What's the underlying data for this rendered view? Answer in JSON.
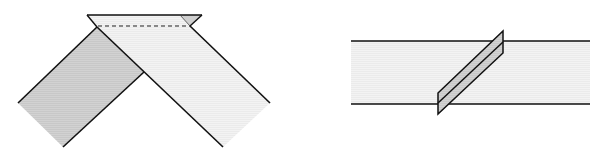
{
  "diagram": {
    "colors": {
      "background": "#ffffff",
      "stroke": "#111111",
      "light_fill": "#f0f0f0",
      "dark_fill": "#cfcfcf",
      "fold_fill": "#c8c8c8"
    },
    "left_figure": {
      "name": "strip-folded-at-angle",
      "top_edge": [
        [
          87,
          15
        ],
        [
          202,
          15
        ]
      ],
      "dashed_fold_line": [
        [
          98,
          26
        ],
        [
          190,
          26
        ]
      ],
      "dark_band": [
        [
          97,
          27
        ],
        [
          144,
          72
        ],
        [
          63,
          147
        ],
        [
          18,
          103
        ]
      ],
      "light_band": [
        [
          87,
          15
        ],
        [
          202,
          15
        ],
        [
          190,
          26
        ],
        [
          270,
          103
        ],
        [
          223,
          147
        ],
        [
          97,
          27
        ]
      ],
      "small_triangle": [
        [
          180,
          15
        ],
        [
          202,
          15
        ],
        [
          190,
          26
        ]
      ]
    },
    "right_figure": {
      "name": "strip-with-z-fold",
      "band_top_y": 41,
      "band_bottom_y": 104,
      "band_x": [
        351,
        590
      ],
      "fold_outer": [
        [
          438,
          93
        ],
        [
          503,
          31
        ],
        [
          503,
          53
        ],
        [
          438,
          114
        ]
      ],
      "fold_middle_line": [
        [
          438,
          103
        ],
        [
          503,
          42
        ]
      ]
    }
  }
}
